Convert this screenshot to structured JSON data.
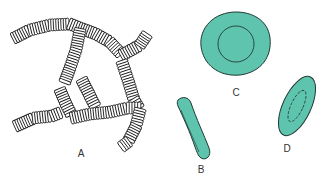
{
  "diagram": {
    "colors": {
      "cell_fill": "#5fc4ad",
      "outline": "#1f3b36",
      "ink": "#222222",
      "background": "#ffffff"
    },
    "panels": [
      {
        "id": "A",
        "label": "A",
        "description": "rouleaux formation - stacked cells in branching chains",
        "label_pos": [
          81,
          158
        ]
      },
      {
        "id": "B",
        "label": "B",
        "description": "cell seen edge-on (side view)",
        "label_pos": [
          201,
          173
        ]
      },
      {
        "id": "C",
        "label": "C",
        "description": "cell seen face-on with central pallor",
        "label_pos": [
          236,
          100
        ]
      },
      {
        "id": "D",
        "label": "D",
        "description": "cell seen obliquely",
        "label_pos": [
          287,
          154
        ]
      }
    ]
  }
}
